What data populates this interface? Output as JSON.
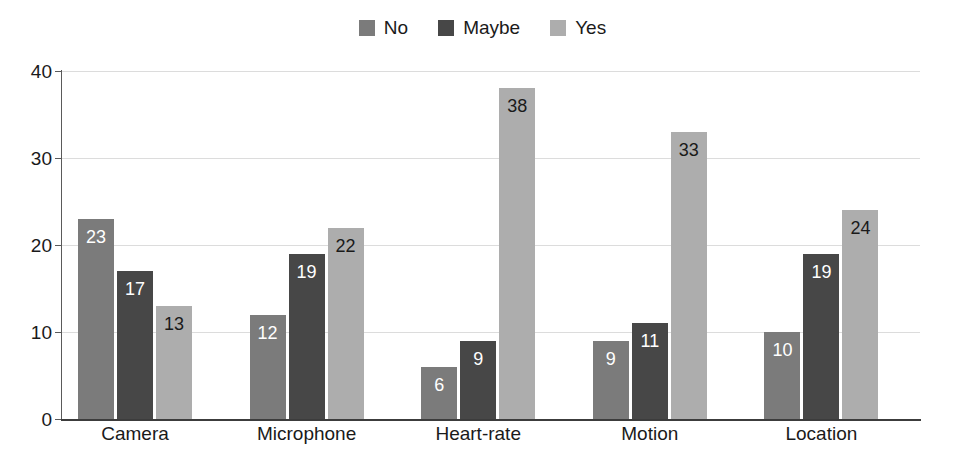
{
  "chart_data": {
    "type": "bar",
    "title": "",
    "subtitle": "",
    "xlabel": "",
    "ylabel": "",
    "categories": [
      "Camera",
      "Microphone",
      "Heart-rate",
      "Motion",
      "Location"
    ],
    "series": [
      {
        "name": "No",
        "values": [
          23,
          12,
          6,
          9,
          10
        ],
        "color": "#7b7b7b",
        "label_color": "#ffffff"
      },
      {
        "name": "Maybe",
        "values": [
          17,
          19,
          9,
          11,
          19
        ],
        "color": "#474747",
        "label_color": "#ffffff"
      },
      {
        "name": "Yes",
        "values": [
          13,
          22,
          38,
          33,
          24
        ],
        "color": "#adadad",
        "label_color": "#1a1a1a"
      }
    ],
    "ylim": [
      0,
      40
    ],
    "yticks": [
      0,
      10,
      20,
      30,
      40
    ],
    "ytick_labels": [
      "0",
      "10",
      "20",
      "30",
      "40"
    ],
    "grid": true,
    "grid_axis": "y",
    "grid_color": "#dcdcdc",
    "legend_position": "top-center",
    "show_data_labels": true,
    "data_label_position": "inside-top",
    "background_color": "#ffffff",
    "axis_color": "#3c3c3c"
  }
}
